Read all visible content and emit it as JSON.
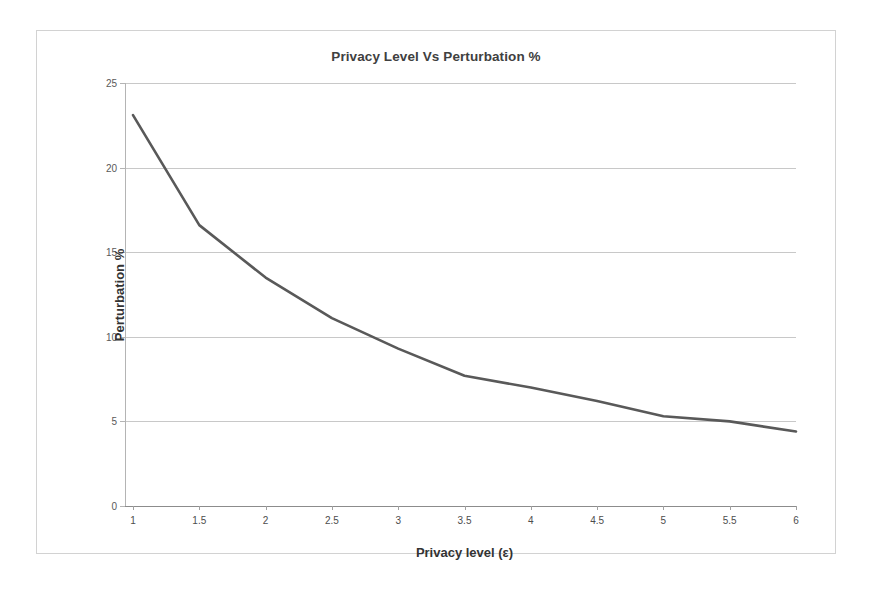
{
  "chart_data": {
    "type": "line",
    "title": "Privacy Level Vs Perturbation %",
    "xlabel": "Privacy level (ε)",
    "ylabel": "Perturbation %",
    "x": [
      1,
      1.5,
      2,
      2.5,
      3,
      3.5,
      4,
      4.5,
      5,
      5.5,
      6
    ],
    "values": [
      23.1,
      16.6,
      13.5,
      11.1,
      9.3,
      7.7,
      7.0,
      6.2,
      5.3,
      5.0,
      4.4
    ],
    "series": [
      {
        "name": "Perturbation %",
        "values": [
          23.1,
          16.6,
          13.5,
          11.1,
          9.3,
          7.7,
          7.0,
          6.2,
          5.3,
          5.0,
          4.4
        ],
        "color": "#595959"
      }
    ],
    "xtick_labels": [
      "1",
      "1.5",
      "2",
      "2.5",
      "3",
      "3.5",
      "4",
      "4.5",
      "5",
      "5.5",
      "6"
    ],
    "ytick_labels": [
      "0",
      "5",
      "10",
      "15",
      "20",
      "25"
    ],
    "yticks": [
      0,
      5,
      10,
      15,
      20,
      25
    ],
    "xlim": [
      1,
      6
    ],
    "ylim": [
      0,
      25
    ],
    "grid": "horizontal",
    "legend": "none",
    "gridline_color": "#c8c8c8",
    "line_color": "#595959",
    "frame_color": "#d2d2d2",
    "background": "#ffffff"
  }
}
